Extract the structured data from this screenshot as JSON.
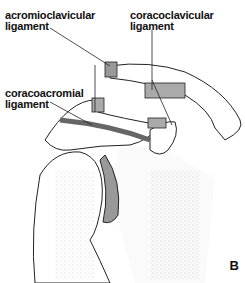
{
  "labels": {
    "acromioclavicular": [
      "acromioclavicular",
      "ligament"
    ],
    "coracoclavicular": [
      "coracoclavicular",
      "ligament"
    ],
    "coracoacromial": [
      "coracoacromial",
      "ligament"
    ]
  },
  "panel_letter": "B",
  "colors": {
    "line": "#222222",
    "ligament": "#888888",
    "stipple": "#999999",
    "background": "#ffffff"
  }
}
